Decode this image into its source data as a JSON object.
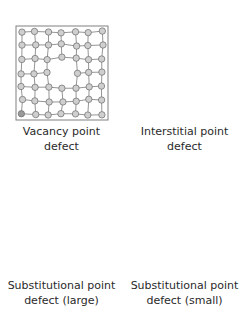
{
  "figure": {
    "colors": {
      "atom_fill": "#cfcfcf",
      "atom_stroke": "#6a6a6a",
      "bond": "#7a7a7a",
      "frame": "#808080",
      "interstitial_atom": "#5a5a5a",
      "large_atom": "#555555",
      "small_atom": "#3a3a3a",
      "text": "#2a2a2a"
    },
    "panels": [
      {
        "id": "vacancy",
        "line1": "Vacancy point",
        "line2": "defect",
        "defect": "vacancy"
      },
      {
        "id": "interstitial",
        "line1": "Interstitial point",
        "line2": "defect",
        "defect": "interstitial"
      },
      {
        "id": "substitutional-large",
        "line1": "Substitutional point",
        "line2": "defect (large)",
        "defect": "large"
      },
      {
        "id": "substitutional-small",
        "line1": "Substitutional point",
        "line2": "defect (small)",
        "defect": "small"
      }
    ],
    "lattice": {
      "rows": 7,
      "cols": 7
    }
  }
}
